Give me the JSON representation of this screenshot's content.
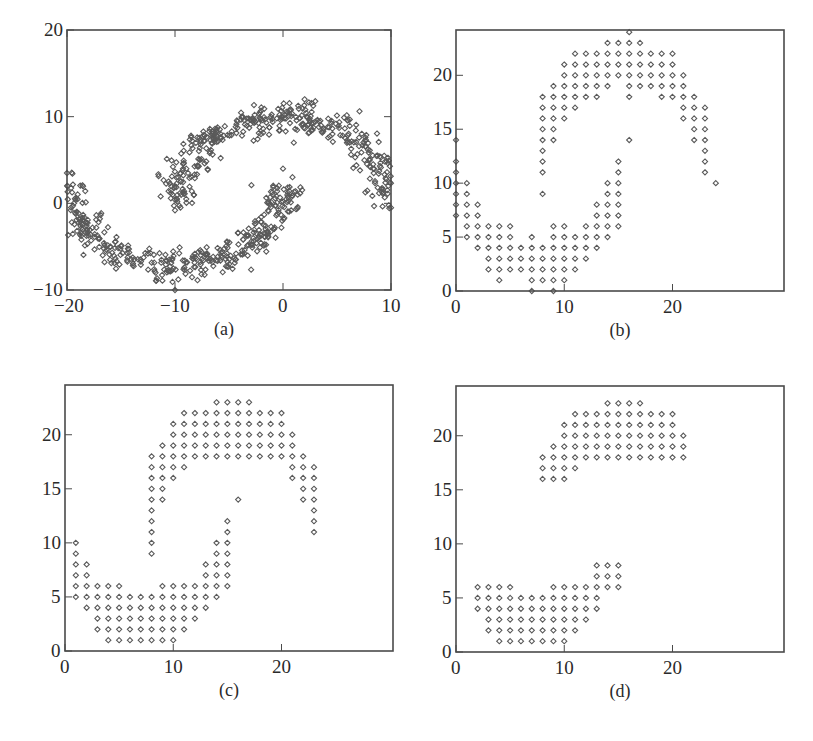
{
  "figure": {
    "panels_layout": "2x2 grid of scatter plots",
    "marker": "small hollow diamond",
    "colors": {
      "frame": "#4a4a4a",
      "marker": "#5a5a5a",
      "text": "#2a2a2a",
      "background": "#ffffff"
    }
  },
  "chart_data": [
    {
      "id": "a",
      "type": "scatter",
      "caption": "(a)",
      "title": "",
      "xlabel": "",
      "ylabel": "",
      "xlim": [
        -20,
        10
      ],
      "ylim": [
        -10,
        20
      ],
      "xticks": [
        -20,
        -10,
        0,
        10
      ],
      "xtick_labels": [
        "−20",
        "−10",
        "0",
        "10"
      ],
      "yticks": [
        -10,
        0,
        10,
        20
      ],
      "ytick_labels": [
        "−10",
        "0",
        "10",
        "20"
      ],
      "grid": false,
      "legend": null,
      "description": "Noisy two-moons data: upper arc centered near (0,0) radius ~10 spanning x from -10 to 10 (peak y~10); lower arc centered near (-10,0) radius ~10 spanning x from -20 to 0 (trough y~-7).",
      "generator": {
        "seed": 7,
        "n_per_moon": 420,
        "noise": 0.9,
        "upper_moon": {
          "cx": 0,
          "cy": 0,
          "r": 10,
          "angle_from_deg": 0,
          "angle_to_deg": 180
        },
        "lower_moon": {
          "cx": -10,
          "cy": 2,
          "r": 10,
          "angle_from_deg": 180,
          "angle_to_deg": 360,
          "y_scale": 0.9
        }
      },
      "notable_points": [
        [
          -10,
          -0.8
        ],
        [
          0,
          4
        ],
        [
          1,
          7
        ],
        [
          -20,
          3.5
        ],
        [
          -10,
          -10
        ],
        [
          10,
          -0.5
        ],
        [
          2,
          12
        ]
      ]
    },
    {
      "id": "b",
      "type": "scatter",
      "caption": "(b)",
      "title": "",
      "xlabel": "",
      "ylabel": "",
      "xlim": [
        0,
        30.3
      ],
      "ylim": [
        0,
        24.2
      ],
      "xticks": [
        0,
        10,
        20
      ],
      "xtick_labels": [
        "0",
        "10",
        "20"
      ],
      "yticks": [
        0,
        5,
        10,
        15,
        20
      ],
      "ytick_labels": [
        "0",
        "5",
        "10",
        "15",
        "20"
      ],
      "grid": false,
      "legend": null,
      "description": "Data from (a) discretized onto an integer grid.",
      "rows": [
        {
          "y": 24,
          "x": [
            16
          ]
        },
        {
          "y": 23,
          "x": [
            14,
            15,
            16,
            17
          ]
        },
        {
          "y": 22,
          "x": [
            11,
            12,
            13,
            14,
            15,
            16,
            17,
            18,
            19,
            20
          ]
        },
        {
          "y": 21,
          "x": [
            10,
            11,
            12,
            13,
            14,
            15,
            16,
            17,
            18,
            19,
            20
          ]
        },
        {
          "y": 20,
          "x": [
            10,
            11,
            12,
            13,
            14,
            15,
            16,
            17,
            18,
            19,
            20,
            21
          ]
        },
        {
          "y": 19,
          "x": [
            9,
            10,
            11,
            12,
            13,
            14,
            16,
            17,
            18,
            19,
            20,
            21
          ]
        },
        {
          "y": 18,
          "x": [
            8,
            9,
            10,
            11,
            12,
            13,
            16,
            19,
            20,
            21,
            22
          ]
        },
        {
          "y": 17,
          "x": [
            8,
            9,
            10,
            11,
            21,
            22,
            23
          ]
        },
        {
          "y": 16,
          "x": [
            8,
            9,
            10,
            21,
            22,
            23
          ]
        },
        {
          "y": 15,
          "x": [
            8,
            9,
            22,
            23
          ]
        },
        {
          "y": 14,
          "x": [
            0,
            8,
            9,
            16,
            22,
            23
          ]
        },
        {
          "y": 13,
          "x": [
            8,
            23
          ]
        },
        {
          "y": 12,
          "x": [
            0,
            8,
            15,
            23
          ]
        },
        {
          "y": 11,
          "x": [
            0,
            8,
            15,
            23
          ]
        },
        {
          "y": 10,
          "x": [
            0,
            1,
            14,
            15,
            24
          ]
        },
        {
          "y": 9,
          "x": [
            0,
            1,
            8,
            14,
            15
          ]
        },
        {
          "y": 8,
          "x": [
            0,
            1,
            2,
            13,
            14,
            15
          ]
        },
        {
          "y": 7,
          "x": [
            0,
            1,
            2,
            13,
            14,
            15
          ]
        },
        {
          "y": 6,
          "x": [
            1,
            2,
            3,
            4,
            5,
            9,
            10,
            12,
            13,
            14,
            15
          ]
        },
        {
          "y": 5,
          "x": [
            1,
            2,
            3,
            4,
            5,
            7,
            9,
            10,
            11,
            12,
            13,
            14
          ]
        },
        {
          "y": 4,
          "x": [
            2,
            3,
            4,
            5,
            6,
            7,
            8,
            9,
            10,
            11,
            12,
            13
          ]
        },
        {
          "y": 3,
          "x": [
            3,
            4,
            5,
            6,
            7,
            8,
            9,
            10,
            11,
            12
          ]
        },
        {
          "y": 2,
          "x": [
            3,
            4,
            5,
            6,
            7,
            8,
            9,
            10,
            11
          ]
        },
        {
          "y": 1,
          "x": [
            4,
            7,
            8,
            9,
            10
          ]
        },
        {
          "y": 0,
          "x": [
            7,
            9
          ]
        }
      ]
    },
    {
      "id": "c",
      "type": "scatter",
      "caption": "(c)",
      "title": "",
      "xlabel": "",
      "ylabel": "",
      "xlim": [
        0,
        30.3
      ],
      "ylim": [
        0,
        24.6
      ],
      "xticks": [
        0,
        10,
        20
      ],
      "xtick_labels": [
        "0",
        "10",
        "20"
      ],
      "yticks": [
        0,
        5,
        10,
        15,
        20
      ],
      "ytick_labels": [
        "0",
        "5",
        "10",
        "15",
        "20"
      ],
      "grid": false,
      "legend": null,
      "description": "Grid points after refinement (outliers removed).",
      "rows": [
        {
          "y": 23,
          "x": [
            14,
            15,
            16,
            17
          ]
        },
        {
          "y": 22,
          "x": [
            11,
            12,
            13,
            14,
            15,
            16,
            17,
            18,
            19,
            20
          ]
        },
        {
          "y": 21,
          "x": [
            10,
            11,
            12,
            13,
            14,
            15,
            16,
            17,
            18,
            19,
            20
          ]
        },
        {
          "y": 20,
          "x": [
            10,
            11,
            12,
            13,
            14,
            15,
            16,
            17,
            18,
            19,
            20,
            21
          ]
        },
        {
          "y": 19,
          "x": [
            9,
            10,
            11,
            12,
            13,
            14,
            15,
            16,
            17,
            18,
            19,
            20,
            21
          ]
        },
        {
          "y": 18,
          "x": [
            8,
            9,
            10,
            11,
            12,
            13,
            14,
            15,
            16,
            17,
            18,
            19,
            20,
            21,
            22
          ]
        },
        {
          "y": 17,
          "x": [
            8,
            9,
            10,
            11,
            21,
            22,
            23
          ]
        },
        {
          "y": 16,
          "x": [
            8,
            9,
            10,
            21,
            22,
            23
          ]
        },
        {
          "y": 15,
          "x": [
            8,
            9,
            22,
            23
          ]
        },
        {
          "y": 14,
          "x": [
            8,
            9,
            16,
            22,
            23
          ]
        },
        {
          "y": 13,
          "x": [
            8,
            23
          ]
        },
        {
          "y": 12,
          "x": [
            8,
            15,
            23
          ]
        },
        {
          "y": 11,
          "x": [
            8,
            15,
            23
          ]
        },
        {
          "y": 10,
          "x": [
            1,
            8,
            14,
            15
          ]
        },
        {
          "y": 9,
          "x": [
            1,
            8,
            14,
            15
          ]
        },
        {
          "y": 8,
          "x": [
            1,
            2,
            13,
            14,
            15
          ]
        },
        {
          "y": 7,
          "x": [
            1,
            2,
            13,
            14,
            15
          ]
        },
        {
          "y": 6,
          "x": [
            1,
            2,
            3,
            4,
            5,
            9,
            10,
            11,
            12,
            13,
            14,
            15
          ]
        },
        {
          "y": 5,
          "x": [
            1,
            2,
            3,
            4,
            5,
            6,
            7,
            8,
            9,
            10,
            11,
            12,
            13,
            14
          ]
        },
        {
          "y": 4,
          "x": [
            2,
            3,
            4,
            5,
            6,
            7,
            8,
            9,
            10,
            11,
            12,
            13
          ]
        },
        {
          "y": 3,
          "x": [
            3,
            4,
            5,
            6,
            7,
            8,
            9,
            10,
            11,
            12
          ]
        },
        {
          "y": 2,
          "x": [
            3,
            4,
            5,
            6,
            7,
            8,
            9,
            10,
            11
          ]
        },
        {
          "y": 1,
          "x": [
            4,
            5,
            6,
            7,
            8,
            9,
            10
          ]
        }
      ]
    },
    {
      "id": "d",
      "type": "scatter",
      "caption": "(d)",
      "title": "",
      "xlabel": "",
      "ylabel": "",
      "xlim": [
        0,
        30.3
      ],
      "ylim": [
        0,
        24.6
      ],
      "xticks": [
        0,
        10,
        20
      ],
      "xtick_labels": [
        "0",
        "10",
        "20"
      ],
      "yticks": [
        0,
        5,
        10,
        15,
        20
      ],
      "ytick_labels": [
        "0",
        "5",
        "10",
        "15",
        "20"
      ],
      "grid": false,
      "legend": null,
      "description": "Dense core grid points only (two clusters).",
      "rows": [
        {
          "y": 23,
          "x": [
            14,
            15,
            16,
            17
          ]
        },
        {
          "y": 22,
          "x": [
            11,
            12,
            13,
            14,
            15,
            16,
            17,
            18,
            19,
            20
          ]
        },
        {
          "y": 21,
          "x": [
            10,
            11,
            12,
            13,
            14,
            15,
            16,
            17,
            18,
            19,
            20
          ]
        },
        {
          "y": 20,
          "x": [
            10,
            11,
            12,
            13,
            14,
            15,
            16,
            17,
            18,
            19,
            20,
            21
          ]
        },
        {
          "y": 19,
          "x": [
            9,
            10,
            11,
            12,
            13,
            14,
            15,
            16,
            17,
            18,
            19,
            20,
            21
          ]
        },
        {
          "y": 18,
          "x": [
            8,
            9,
            10,
            11,
            12,
            13,
            14,
            15,
            16,
            17,
            18,
            19,
            20,
            21
          ]
        },
        {
          "y": 17,
          "x": [
            8,
            9,
            10,
            11
          ]
        },
        {
          "y": 16,
          "x": [
            8,
            9,
            10
          ]
        },
        {
          "y": 8,
          "x": [
            13,
            14,
            15
          ]
        },
        {
          "y": 7,
          "x": [
            13,
            14,
            15
          ]
        },
        {
          "y": 6,
          "x": [
            2,
            3,
            4,
            5,
            9,
            10,
            11,
            12,
            13,
            14,
            15
          ]
        },
        {
          "y": 5,
          "x": [
            2,
            3,
            4,
            5,
            6,
            7,
            8,
            9,
            10,
            11,
            12,
            13
          ]
        },
        {
          "y": 4,
          "x": [
            2,
            3,
            4,
            5,
            6,
            7,
            8,
            9,
            10,
            11,
            12,
            13
          ]
        },
        {
          "y": 3,
          "x": [
            3,
            4,
            5,
            6,
            7,
            8,
            9,
            10,
            11,
            12
          ]
        },
        {
          "y": 2,
          "x": [
            3,
            4,
            5,
            6,
            7,
            8,
            9,
            10,
            11
          ]
        },
        {
          "y": 1,
          "x": [
            4,
            5,
            6,
            7,
            8,
            9,
            10
          ]
        }
      ]
    }
  ],
  "layout_frames": {
    "a": {
      "left": 67,
      "top": 30,
      "right": 391,
      "bottom": 290
    },
    "b": {
      "left": 456,
      "top": 30,
      "right": 784,
      "bottom": 291
    },
    "c": {
      "left": 65,
      "top": 385,
      "right": 393,
      "bottom": 651
    },
    "d": {
      "left": 456,
      "top": 386,
      "right": 784,
      "bottom": 652
    }
  }
}
